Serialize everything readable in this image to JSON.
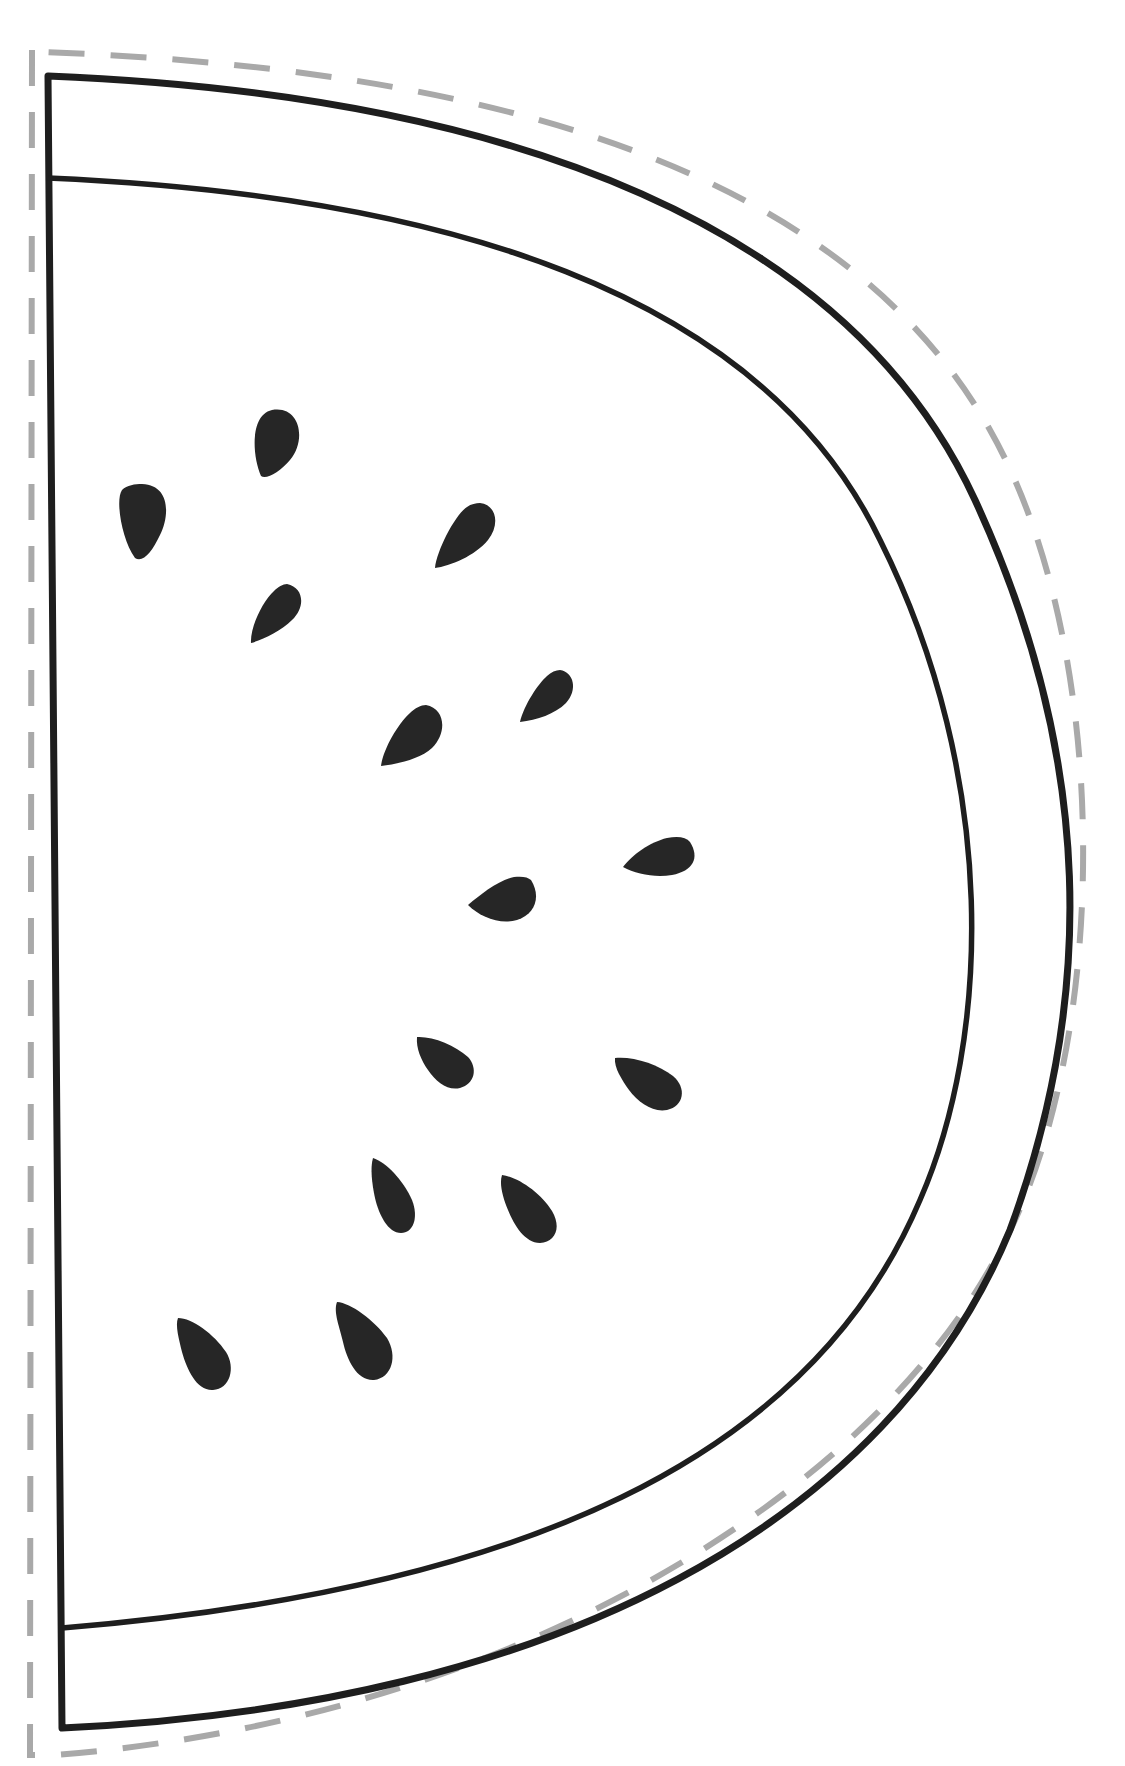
{
  "template": {
    "subject": "watermelon-slice",
    "colors": {
      "background": "#ffffff",
      "outline": "#1e1e1e",
      "cut_line": "#a9a9a9",
      "seed": "#262626"
    },
    "seed_count": 17
  },
  "seeds": [
    {
      "cx": 278,
      "cy": 443,
      "rx": 21,
      "ry": 36,
      "rot": 12
    },
    {
      "cx": 142,
      "cy": 522,
      "rx": 23,
      "ry": 39,
      "rot": -5
    },
    {
      "cx": 471,
      "cy": 534,
      "rx": 22,
      "ry": 37,
      "rot": 45
    },
    {
      "cx": 278,
      "cy": 613,
      "rx": 21,
      "ry": 34,
      "rot": 48
    },
    {
      "cx": 550,
      "cy": 697,
      "rx": 20,
      "ry": 32,
      "rot": 50
    },
    {
      "cx": 415,
      "cy": 735,
      "rx": 25,
      "ry": 37,
      "rot": 55
    },
    {
      "cx": 660,
      "cy": 853,
      "rx": 23,
      "ry": 38,
      "rot": 85
    },
    {
      "cx": 505,
      "cy": 900,
      "rx": 23,
      "ry": 37,
      "rot": 95
    },
    {
      "cx": 446,
      "cy": 1062,
      "rx": 22,
      "ry": 34,
      "rot": -50
    },
    {
      "cx": 652,
      "cy": 1085,
      "rx": 23,
      "ry": 38,
      "rot": -60
    },
    {
      "cx": 393,
      "cy": 1195,
      "rx": 20,
      "ry": 38,
      "rot": -22
    },
    {
      "cx": 533,
      "cy": 1210,
      "rx": 23,
      "ry": 37,
      "rot": -38
    },
    {
      "cx": 205,
      "cy": 1357,
      "rx": 22,
      "ry": 37,
      "rot": -28
    },
    {
      "cx": 363,
      "cy": 1343,
      "rx": 22,
      "ry": 39,
      "rot": -25
    }
  ]
}
